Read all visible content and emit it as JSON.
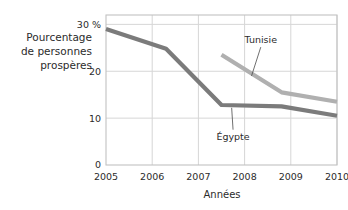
{
  "chart_data": {
    "type": "line",
    "title": "",
    "xlabel": "Années",
    "ylabel_lines": [
      "Pourcentage",
      "de personnes",
      "prospères"
    ],
    "x": [
      2005,
      2006,
      2007,
      2008,
      2009,
      2010
    ],
    "xtick_labels": [
      "2005",
      "2006",
      "2007",
      "2008",
      "2009",
      "2010"
    ],
    "ytick_labels": [
      "0",
      "10",
      "20",
      "30 %"
    ],
    "yticks": [
      0,
      10,
      20,
      30
    ],
    "xlim": [
      2005,
      2010
    ],
    "ylim": [
      0,
      32
    ],
    "grid": true,
    "legend_position": "inline-annotations",
    "series": [
      {
        "name": "Égypte",
        "color": "#7b7b7b",
        "points": [
          {
            "x": 2005.0,
            "y": 29.0
          },
          {
            "x": 2006.3,
            "y": 24.8
          },
          {
            "x": 2007.5,
            "y": 12.8
          },
          {
            "x": 2008.8,
            "y": 12.5
          },
          {
            "x": 2010.0,
            "y": 10.5
          }
        ]
      },
      {
        "name": "Tunisie",
        "color": "#b0b0b0",
        "points": [
          {
            "x": 2007.5,
            "y": 23.5
          },
          {
            "x": 2008.8,
            "y": 15.5
          },
          {
            "x": 2010.0,
            "y": 13.5
          }
        ]
      }
    ],
    "annotations": [
      {
        "label": "Tunisie",
        "text_x": 2008.35,
        "text_y": 26.0,
        "leader_to_x": 2008.15,
        "leader_to_y": 19.0
      },
      {
        "label": "Égypte",
        "text_x": 2007.75,
        "text_y": 5.4,
        "leader_to_x": 2007.72,
        "leader_to_y": 12.2
      }
    ]
  }
}
